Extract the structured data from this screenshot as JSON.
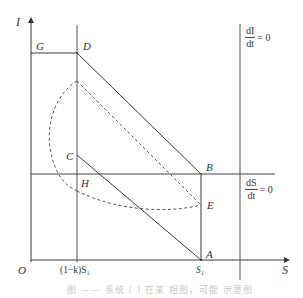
{
  "diagram": {
    "axes": {
      "y_label": "I",
      "x_label": "S",
      "origin_label": "O"
    },
    "ticks": {
      "x1": "(1−k)S₁",
      "x2": "S₁"
    },
    "points": {
      "G": "G",
      "D": "D",
      "C": "C",
      "H": "H",
      "B": "B",
      "E": "E",
      "A": "A"
    },
    "nullclines": {
      "dI": {
        "num": "dI",
        "den": "dt",
        "eq": "= 0"
      },
      "dS": {
        "num": "dS",
        "den": "dt",
        "eq": "= 0"
      }
    },
    "colors": {
      "line": "#3a3a3a",
      "dashed": "#555555",
      "text": "#333333"
    }
  },
  "caption": "图 —— 系统 ( ) 在某 相图，可能 示意图"
}
